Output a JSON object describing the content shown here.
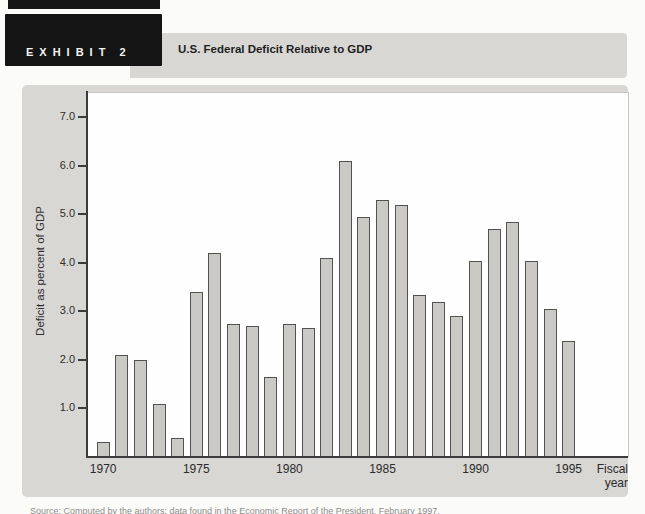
{
  "header": {
    "exhibit_label": "EXHIBIT",
    "exhibit_number": "2",
    "title": "U.S. Federal Deficit Relative to GDP"
  },
  "footer": {
    "source": "Source: Computed by the authors; data found in the Economic Report of the President, February 1997."
  },
  "chart_data": {
    "type": "bar",
    "title": "U.S. Federal Deficit Relative to GDP",
    "xlabel": "Fiscal year",
    "ylabel": "Deficit as percent of GDP",
    "x": [
      1970,
      1971,
      1972,
      1973,
      1974,
      1975,
      1976,
      1977,
      1978,
      1979,
      1980,
      1981,
      1982,
      1983,
      1984,
      1985,
      1986,
      1987,
      1988,
      1989,
      1990,
      1991,
      1992,
      1993,
      1994,
      1995
    ],
    "values": [
      0.3,
      2.1,
      2.0,
      1.1,
      0.4,
      3.4,
      4.2,
      2.75,
      2.7,
      1.65,
      2.75,
      2.65,
      4.1,
      6.1,
      4.95,
      5.3,
      5.2,
      3.35,
      3.2,
      2.9,
      4.05,
      4.7,
      4.85,
      4.05,
      3.05,
      2.4
    ],
    "yticks": [
      1.0,
      2.0,
      3.0,
      4.0,
      5.0,
      6.0,
      7.0
    ],
    "ytick_labels": [
      "1.0",
      "2.0",
      "3.0",
      "4.0",
      "5.0",
      "6.0",
      "7.0"
    ],
    "xtick_years": [
      1970,
      1975,
      1980,
      1985,
      1990,
      1995
    ],
    "xtick_labels": [
      "1970",
      "1975",
      "1980",
      "1985",
      "1990",
      "1995"
    ],
    "ylim": [
      0,
      7.5
    ],
    "grid": false,
    "legend": null,
    "bar_color": "#cac9c6",
    "bar_border": "#525250",
    "panel_color": "#d8d7d4"
  }
}
